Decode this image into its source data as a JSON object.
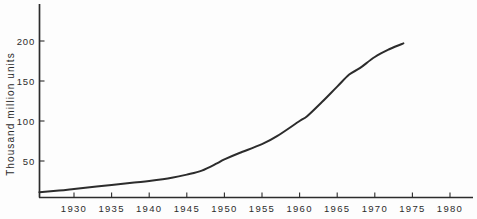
{
  "figure": {
    "paper_color": "#fdfdfd",
    "ink_color": "#2c2c2c"
  },
  "chart_data": {
    "type": "line",
    "title": "",
    "xlabel": "",
    "ylabel": "Thousand million units",
    "grid": false,
    "legend": null,
    "xlim": [
      1925.4,
      1983.1
    ],
    "ylim": [
      0,
      246
    ],
    "x_ticks": [
      1930,
      1935,
      1940,
      1945,
      1950,
      1955,
      1960,
      1965,
      1970,
      1975,
      1980
    ],
    "y_ticks": [
      50,
      100,
      150,
      200
    ],
    "series": [
      {
        "x": [
          1925.4,
          1928,
          1930,
          1933,
          1935,
          1938,
          1940,
          1943,
          1945,
          1947,
          1949,
          1950,
          1952,
          1955,
          1957,
          1960,
          1961,
          1963,
          1965,
          1966.6,
          1968,
          1970,
          1972,
          1973.8
        ],
        "y": [
          11,
          13,
          15,
          18,
          20,
          23,
          25,
          29,
          33,
          38,
          47,
          52,
          60,
          71,
          81,
          100,
          106,
          124,
          143,
          158,
          166,
          180,
          190,
          197
        ]
      }
    ]
  }
}
